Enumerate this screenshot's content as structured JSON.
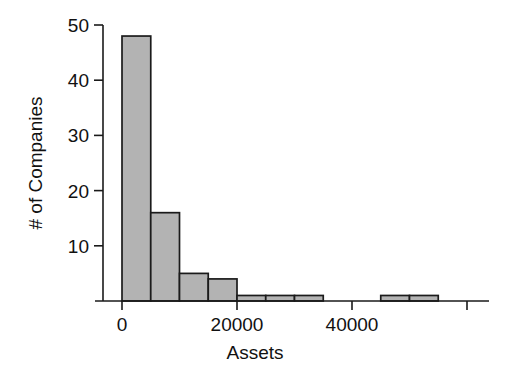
{
  "chart_data": {
    "type": "bar",
    "title": "",
    "subtitle": "",
    "xlabel": "Assets",
    "ylabel": "# of Companies",
    "xlim": [
      -2500,
      61000
    ],
    "ylim": [
      0,
      50
    ],
    "grid": false,
    "legend": null,
    "bin_width": 5000,
    "xticks": [
      0,
      20000,
      40000,
      60000
    ],
    "xticklabels": [
      "0",
      "20000",
      "40000",
      ""
    ],
    "yticks": [
      10,
      20,
      30,
      40,
      50
    ],
    "yticklabels": [
      "10",
      "20",
      "30",
      "40",
      "50"
    ],
    "bin_starts": [
      0,
      5000,
      10000,
      15000,
      20000,
      25000,
      30000,
      35000,
      40000,
      45000,
      50000
    ],
    "categories": [
      "0-5000",
      "5000-10000",
      "10000-15000",
      "15000-20000",
      "20000-25000",
      "25000-30000",
      "30000-35000",
      "35000-40000",
      "40000-45000",
      "45000-50000",
      "50000-55000"
    ],
    "values": [
      48,
      16,
      5,
      4,
      1,
      1,
      1,
      0,
      0,
      1,
      1
    ],
    "bar_fill_color": "#b3b3b3",
    "bar_edge_color": "#1b1b1b",
    "axis_color": "#1a1a1a"
  },
  "labels": {
    "xaxis_title": "Assets",
    "yaxis_title": "# of Companies",
    "xtick_0": "0",
    "xtick_20000": "20000",
    "xtick_40000": "40000",
    "ytick_10": "10",
    "ytick_20": "20",
    "ytick_30": "30",
    "ytick_40": "40",
    "ytick_50": "50"
  }
}
